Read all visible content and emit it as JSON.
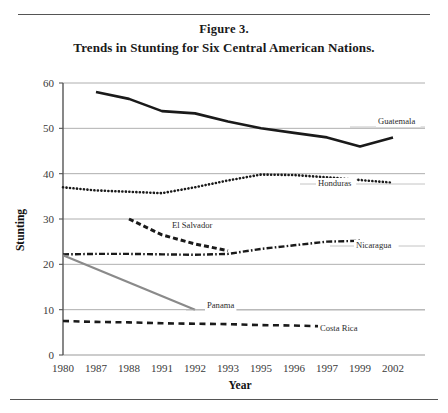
{
  "figure": {
    "number_label": "Figure 3.",
    "title": "Trends in Stunting for Six Central American Nations."
  },
  "chart_data": {
    "type": "line",
    "title": "Trends in Stunting for Six Central American Nations.",
    "xlabel": "Year",
    "ylabel": "Stunting",
    "categories": [
      "1980",
      "1987",
      "1988",
      "1991",
      "1992",
      "1993",
      "1995",
      "1996",
      "1997",
      "1999",
      "2002"
    ],
    "ylim": [
      0,
      60
    ],
    "yticks": [
      0,
      10,
      20,
      30,
      40,
      50,
      60
    ],
    "grid": "horizontal",
    "legend_position": "inline-right-labels",
    "series": [
      {
        "name": "Guatemala",
        "style": "solid-thick",
        "color": "#1a1a1a",
        "points": [
          {
            "x": "1987",
            "y": 58.0
          },
          {
            "x": "1988",
            "y": 56.5
          },
          {
            "x": "1991",
            "y": 53.8
          },
          {
            "x": "1992",
            "y": 53.3
          },
          {
            "x": "1993",
            "y": 51.5
          },
          {
            "x": "1995",
            "y": 50.0
          },
          {
            "x": "1996",
            "y": 49.0
          },
          {
            "x": "1997",
            "y": 48.0
          },
          {
            "x": "1999",
            "y": 46.0
          },
          {
            "x": "2002",
            "y": 48.0
          }
        ]
      },
      {
        "name": "Honduras",
        "style": "dotted",
        "color": "#1a1a1a",
        "points": [
          {
            "x": "1980",
            "y": 37.0
          },
          {
            "x": "1987",
            "y": 36.3
          },
          {
            "x": "1988",
            "y": 36.0
          },
          {
            "x": "1991",
            "y": 35.7
          },
          {
            "x": "1992",
            "y": 37.0
          },
          {
            "x": "1993",
            "y": 38.5
          },
          {
            "x": "1995",
            "y": 39.8
          },
          {
            "x": "1996",
            "y": 39.7
          },
          {
            "x": "1997",
            "y": 39.2
          },
          {
            "x": "1999",
            "y": 38.6
          },
          {
            "x": "2002",
            "y": 38.0
          }
        ]
      },
      {
        "name": "El Salvador",
        "style": "dashed-thick",
        "color": "#1a1a1a",
        "points": [
          {
            "x": "1988",
            "y": 30.0
          },
          {
            "x": "1991",
            "y": 26.5
          },
          {
            "x": "1992",
            "y": 24.5
          },
          {
            "x": "1993",
            "y": 23.0
          }
        ]
      },
      {
        "name": "Nicaragua",
        "style": "dash-dot",
        "color": "#1a1a1a",
        "points": [
          {
            "x": "1980",
            "y": 22.2
          },
          {
            "x": "1987",
            "y": 22.3
          },
          {
            "x": "1988",
            "y": 22.3
          },
          {
            "x": "1991",
            "y": 22.2
          },
          {
            "x": "1992",
            "y": 22.1
          },
          {
            "x": "1993",
            "y": 22.3
          },
          {
            "x": "1995",
            "y": 23.4
          },
          {
            "x": "1996",
            "y": 24.2
          },
          {
            "x": "1997",
            "y": 25.0
          },
          {
            "x": "1999",
            "y": 25.2
          }
        ]
      },
      {
        "name": "Panama",
        "style": "solid-gray",
        "color": "#8a8a8a",
        "points": [
          {
            "x": "1980",
            "y": 22.0
          },
          {
            "x": "1992",
            "y": 10.0
          }
        ]
      },
      {
        "name": "Costa Rica",
        "style": "dashed",
        "color": "#1a1a1a",
        "points": [
          {
            "x": "1980",
            "y": 7.5
          },
          {
            "x": "1987",
            "y": 7.3
          },
          {
            "x": "1988",
            "y": 7.2
          },
          {
            "x": "1991",
            "y": 7.0
          },
          {
            "x": "1992",
            "y": 6.9
          },
          {
            "x": "1993",
            "y": 6.8
          },
          {
            "x": "1995",
            "y": 6.6
          },
          {
            "x": "1996",
            "y": 6.5
          },
          {
            "x": "1997",
            "y": 6.3
          },
          {
            "x": "1999",
            "y": 6.1
          }
        ]
      }
    ],
    "annotations": [
      {
        "name": "Guatemala",
        "text": "Guatemala"
      },
      {
        "name": "Honduras",
        "text": "Honduras"
      },
      {
        "name": "El Salvador",
        "text": "El Salvador"
      },
      {
        "name": "Nicaragua",
        "text": "Nicaragua"
      },
      {
        "name": "Panama",
        "text": "Panama"
      },
      {
        "name": "Costa Rica",
        "text": "Costa Rica"
      }
    ]
  }
}
